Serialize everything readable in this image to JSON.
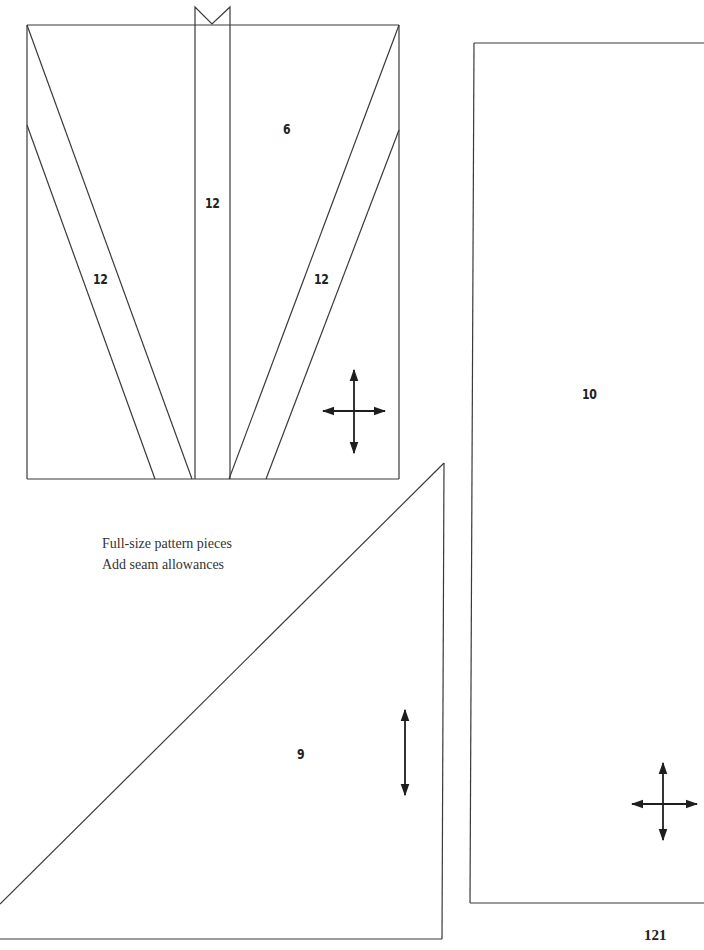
{
  "page": {
    "page_number": "121"
  },
  "notes": {
    "line1": "Full-size pattern pieces",
    "line2": "Add seam allowances"
  },
  "pieces": {
    "top_panel": {
      "label": "6",
      "strips": [
        {
          "label": "12",
          "position": "left-diagonal"
        },
        {
          "label": "12",
          "position": "center-vertical"
        },
        {
          "label": "12",
          "position": "right-diagonal"
        }
      ],
      "grainline": "cross-arrow"
    },
    "tall_rectangle": {
      "label": "10",
      "grainline": "cross-arrow"
    },
    "triangle": {
      "label": "9",
      "grainline": "vertical-arrow"
    }
  },
  "colors": {
    "line": "#3a3a3a",
    "text": "#222222",
    "background": "#ffffff"
  }
}
